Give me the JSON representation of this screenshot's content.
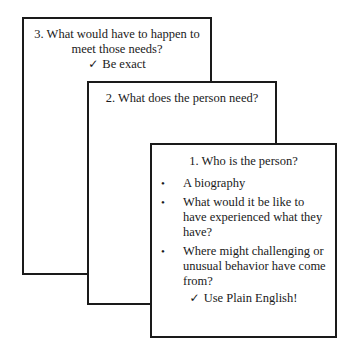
{
  "cards": {
    "card3": {
      "title": "3. What would have to happen to meet those needs?",
      "title_line1": "3. What would have to happen to",
      "title_line2": "meet those needs?",
      "note_icon": "check-icon",
      "note": "Be exact"
    },
    "card2": {
      "title": "2. What does the person need?"
    },
    "card1": {
      "title": "1. Who is the person?",
      "bullets": [
        {
          "text": "A biography"
        },
        {
          "text": "What would it be like to have experienced what they have?"
        },
        {
          "text": "Where might challenging or unusual behavior have come from?"
        }
      ],
      "note_icon": "check-icon",
      "note": "Use Plain English!"
    }
  },
  "glyphs": {
    "check": "✓",
    "bullet": "•"
  },
  "colors": {
    "border": "#1a1a1a",
    "text": "#1a1a1a",
    "background": "#ffffff"
  }
}
